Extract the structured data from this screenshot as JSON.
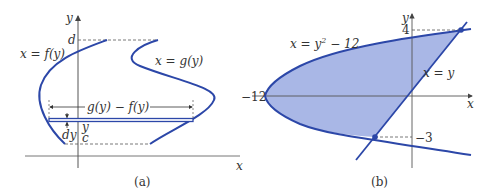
{
  "figure": {
    "panel_a": {
      "caption": "(a)",
      "axis_x": "x",
      "axis_y": "y",
      "left_curve_label": "x = f(y)",
      "right_curve_label": "x = g(y)",
      "top_bound": "d",
      "bottom_bound": "c",
      "strip_y_label": "y",
      "strip_thickness_label": "dy",
      "width_label": "g(y) − f(y)"
    },
    "panel_b": {
      "caption": "(b)",
      "axis_x": "x",
      "axis_y": "y",
      "parabola_label_lhs": "x = y",
      "parabola_exp": "2",
      "parabola_label_rhs": " − 12",
      "line_label": "x = y",
      "x_intercept_label": "−12",
      "upper_y_label": "4",
      "lower_y_label": "−3"
    },
    "colors": {
      "curve": "#2c47a8",
      "fill": "#a9b7e6",
      "axis": "#666666"
    }
  }
}
